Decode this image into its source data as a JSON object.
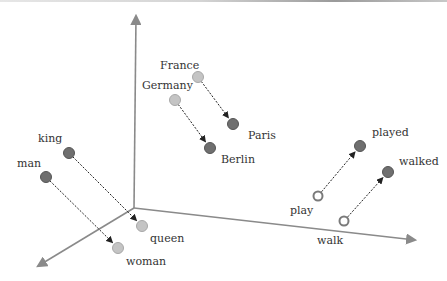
{
  "diagram": {
    "axes": {
      "color": "#8a8a8a",
      "origin": [
        134,
        208
      ],
      "ends": {
        "vertical": [
          136,
          16
        ],
        "horizontal": [
          415,
          240
        ],
        "depth": [
          38,
          266
        ]
      }
    },
    "colors": {
      "dark_node": "#6f6f6f",
      "light_node": "#c4c4c4",
      "hollow_node_stroke": "#7a7a7a",
      "arrow": "#222222",
      "label": "#333333"
    },
    "nodes": {
      "king": {
        "label": "king",
        "x": 69,
        "y": 153,
        "style": "dark"
      },
      "man": {
        "label": "man",
        "x": 46,
        "y": 177,
        "style": "dark"
      },
      "queen": {
        "label": "queen",
        "x": 142,
        "y": 226,
        "style": "light"
      },
      "woman": {
        "label": "woman",
        "x": 118,
        "y": 248,
        "style": "light"
      },
      "france": {
        "label": "France",
        "x": 198,
        "y": 77,
        "style": "light"
      },
      "germany": {
        "label": "Germany",
        "x": 175,
        "y": 100,
        "style": "light"
      },
      "paris": {
        "label": "Paris",
        "x": 233,
        "y": 124,
        "style": "dark"
      },
      "berlin": {
        "label": "Berlin",
        "x": 210,
        "y": 148,
        "style": "dark"
      },
      "play": {
        "label": "play",
        "x": 318,
        "y": 196,
        "style": "hollow"
      },
      "walk": {
        "label": "walk",
        "x": 344,
        "y": 221,
        "style": "hollow"
      },
      "played": {
        "label": "played",
        "x": 360,
        "y": 146,
        "style": "dark"
      },
      "walked": {
        "label": "walked",
        "x": 388,
        "y": 172,
        "style": "dark"
      }
    },
    "edges": [
      {
        "from": "king",
        "to": "queen"
      },
      {
        "from": "man",
        "to": "woman"
      },
      {
        "from": "france",
        "to": "paris"
      },
      {
        "from": "germany",
        "to": "berlin"
      },
      {
        "from": "play",
        "to": "played"
      },
      {
        "from": "walk",
        "to": "walked"
      }
    ],
    "labels": {
      "king": {
        "text": "king",
        "x": 38,
        "y": 133
      },
      "man": {
        "text": "man",
        "x": 17,
        "y": 158
      },
      "queen": {
        "text": "queen",
        "x": 150,
        "y": 233
      },
      "woman": {
        "text": "woman",
        "x": 126,
        "y": 256
      },
      "france": {
        "text": "France",
        "x": 160,
        "y": 60
      },
      "germany": {
        "text": "Germany",
        "x": 142,
        "y": 80
      },
      "paris": {
        "text": "Paris",
        "x": 248,
        "y": 130
      },
      "berlin": {
        "text": "Berlin",
        "x": 221,
        "y": 154
      },
      "play": {
        "text": "play",
        "x": 290,
        "y": 205
      },
      "walk": {
        "text": "walk",
        "x": 317,
        "y": 235
      },
      "played": {
        "text": "played",
        "x": 372,
        "y": 127
      },
      "walked": {
        "text": "walked",
        "x": 399,
        "y": 156
      }
    }
  }
}
